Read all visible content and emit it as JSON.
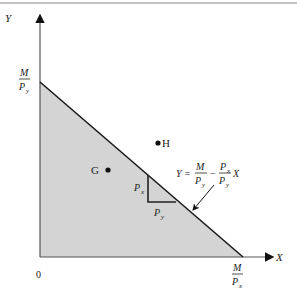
{
  "diagram": {
    "axes": {
      "x_label": "X",
      "y_label": "Y",
      "origin_label": "0"
    },
    "intercepts": {
      "y": {
        "num": "M",
        "den": "P",
        "den_sub": "y"
      },
      "x": {
        "num": "M",
        "den": "P",
        "den_sub": "x"
      }
    },
    "points": [
      {
        "id": "G",
        "label": "G"
      },
      {
        "id": "H",
        "label": "H"
      }
    ],
    "slope_triangle": {
      "vertical_label": "P",
      "vertical_sub": "x",
      "horizontal_label": "P",
      "horizontal_sub": "y"
    },
    "equation": {
      "lhs": "Y =",
      "t1_num": "M",
      "t1_den": "P",
      "t1_den_sub": "y",
      "minus": "−",
      "t2_num": "P",
      "t2_num_sub": "x",
      "t2_den": "P",
      "t2_den_sub": "y",
      "var": "X"
    },
    "colors": {
      "feasible_fill": "#d4d4d4",
      "line": "#1a1a1a",
      "axis": "#444444"
    }
  }
}
